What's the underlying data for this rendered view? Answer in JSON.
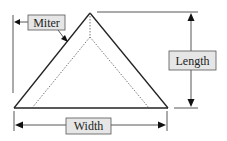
{
  "diagram": {
    "labels": {
      "miter": "Miter",
      "length": "Length",
      "width": "Width"
    },
    "colors": {
      "line": "#222222",
      "label_fill": "#e6e6e6",
      "label_border": "#555555",
      "background": "#ffffff"
    },
    "shape": "triangle frame with mitered inner dashed outline"
  }
}
